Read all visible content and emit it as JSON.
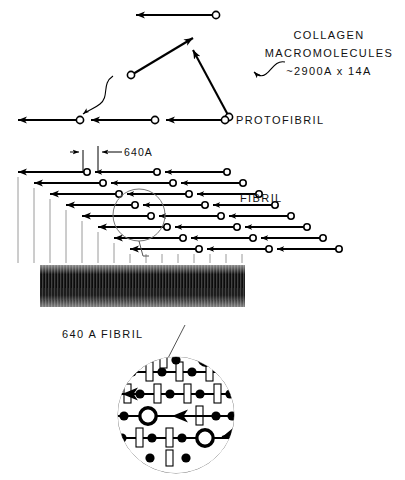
{
  "figure": {
    "background_color": "#ffffff",
    "ink_color": "#000000",
    "tick_color": "#9a9a9a"
  },
  "labels": {
    "collagen_line1": "COLLAGEN",
    "collagen_line2": "MACROMOLECULES",
    "collagen_line3": "~2900A x 14A",
    "protofibril": "PROTOFIBRIL",
    "fibril": "FIBRIL",
    "period": "640A",
    "detail_caption": "640 A FIBRIL"
  },
  "diagram_data": {
    "type": "diagram",
    "molecule_length_angstrom": 2900,
    "molecule_width_angstrom": 14,
    "fibril_period_angstrom": 640,
    "molecule_glyph": {
      "head": "arrowhead-left",
      "tail": "open-circle-right"
    },
    "free_molecules": [
      {
        "name": "molecule-top",
        "x1": 215,
        "y1": 15,
        "x2": 132,
        "y2": 15
      },
      {
        "name": "molecule-diagonal-left",
        "x1": 132,
        "y1": 75,
        "x2": 196,
        "y2": 36
      },
      {
        "name": "molecule-diagonal-right",
        "x1": 228,
        "y1": 117,
        "x2": 190,
        "y2": 48
      }
    ],
    "protofibril_row": {
      "y": 120,
      "segments": [
        {
          "circle_x": 225,
          "arrow_x": 160
        },
        {
          "circle_x": 155,
          "arrow_x": 85
        },
        {
          "circle_x": 80,
          "arrow_x": 12
        }
      ]
    },
    "fibril": {
      "row_count": 8,
      "row_spacing": 11,
      "row_stagger": 14,
      "first_row_y": 172,
      "molecules_per_row": 3,
      "segment_length": 66
    },
    "micrograph": {
      "x": 40,
      "y": 265,
      "width": 205,
      "height": 42,
      "appearance": "dark banded electron micrograph"
    },
    "detail_circle": {
      "center_x": 176,
      "center_y": 415,
      "radius": 59,
      "row_count": 5,
      "contents": "staggered molecules shown as lines with filled nodes and white gap rectangles"
    },
    "magnified_region": {
      "center_x": 139,
      "center_y": 215,
      "radius": 26
    }
  }
}
